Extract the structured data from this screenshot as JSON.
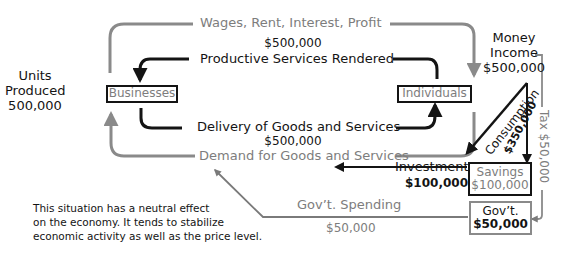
{
  "diagram": {
    "colors": {
      "dark_flow": "#141414",
      "money_flow": "#8a8a8a",
      "gray_text": "#7d7d7d"
    },
    "nodes": {
      "businesses": "Businesses",
      "individuals": "Individuals",
      "savings": {
        "label": "Savings",
        "value": "$100,000"
      },
      "govt": {
        "label": "Gov’t.",
        "value": "$50,000"
      }
    },
    "left_label": {
      "line1": "Units",
      "line2": "Produced",
      "line3": "500,000"
    },
    "money_income": {
      "line1": "Money",
      "line2": "Income",
      "line3": "$500,000"
    },
    "top_flow": {
      "label": "Wages, Rent, Interest, Profit"
    },
    "productive_services": {
      "value": "$500,000",
      "label": "Productive Services Rendered"
    },
    "delivery": {
      "label": "Delivery of Goods and Services",
      "value": "$500,000"
    },
    "demand": {
      "label": "Demand for Goods and Services"
    },
    "consumption": {
      "label": "Consumption",
      "value": "$350,000"
    },
    "tax": {
      "label": "Tax $50,000"
    },
    "investment": {
      "label": "Investment",
      "value": "$100,000"
    },
    "govt_spending": {
      "label": "Gov’t. Spending",
      "value": "$50,000"
    },
    "note": {
      "line1": "This situation has a neutral effect",
      "line2": "on the economy. It tends to stabilize",
      "line3": "economic activity as well as the price level."
    }
  }
}
